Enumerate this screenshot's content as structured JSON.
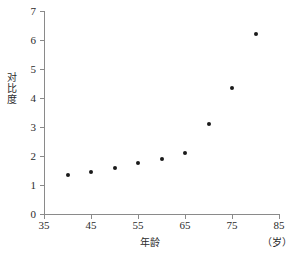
{
  "chart_data": {
    "type": "scatter",
    "title": "",
    "xlabel": "年龄",
    "xunit": "（岁）",
    "ylabel": "对比度",
    "xlim": [
      35,
      85
    ],
    "ylim": [
      0,
      7
    ],
    "xticks": [
      "35",
      "45",
      "55",
      "65",
      "75",
      "85"
    ],
    "xtick_values": [
      35,
      45,
      55,
      65,
      75,
      85
    ],
    "yticks": [
      "0",
      "1",
      "2",
      "3",
      "4",
      "5",
      "6",
      "7"
    ],
    "ytick_values": [
      0,
      1,
      2,
      3,
      4,
      5,
      6,
      7
    ],
    "grid": false,
    "legend": null,
    "series": [
      {
        "name": "对比度",
        "marker": "filled-circle",
        "color": "#1a1a1a",
        "x": [
          40,
          45,
          50,
          55,
          60,
          65,
          70,
          75,
          80
        ],
        "y": [
          1.35,
          1.45,
          1.58,
          1.75,
          1.9,
          2.12,
          3.12,
          4.35,
          6.2
        ]
      }
    ],
    "axis_color": "#8a8a8a",
    "background": "#ffffff"
  }
}
